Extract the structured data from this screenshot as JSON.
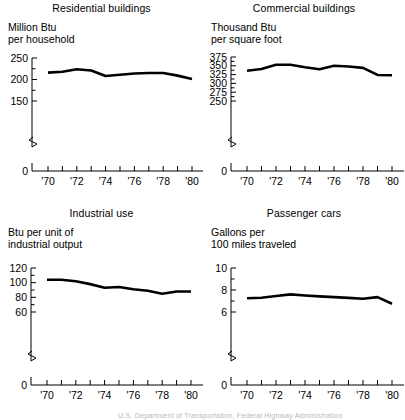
{
  "figure": {
    "footnote": "U.S. Department of Transportation, Federal Highway Administration",
    "line_color": "#000000",
    "background": "#ffffff"
  },
  "panels": [
    {
      "id": "residential",
      "title": "Residential buildings",
      "subtitle": "Million Btu\nper household",
      "ytick_labels": [
        "250",
        "200",
        "150",
        "0"
      ],
      "xtick_labels": [
        "'70",
        "'72",
        "'74",
        "'76",
        "'78",
        "'80"
      ]
    },
    {
      "id": "commercial",
      "title": "Commercial buildings",
      "subtitle": "Thousand Btu\nper square foot",
      "ytick_labels": [
        "375",
        "350",
        "325",
        "300",
        "275",
        "250",
        "0"
      ],
      "xtick_labels": [
        "'70",
        "'72",
        "'74",
        "'76",
        "'78",
        "'80"
      ]
    },
    {
      "id": "industrial",
      "title": "Industrial use",
      "subtitle": "Btu per unit of\nindustrial output",
      "ytick_labels": [
        "120",
        "100",
        "80",
        "60",
        "0"
      ],
      "xtick_labels": [
        "'70",
        "'72",
        "'74",
        "'76",
        "'78",
        "'80"
      ]
    },
    {
      "id": "passenger",
      "title": "Passenger cars",
      "subtitle": "Gallons per\n100 miles traveled",
      "ytick_labels": [
        "10",
        "8",
        "6",
        "0"
      ],
      "xtick_labels": [
        "'70",
        "'72",
        "'74",
        "'76",
        "'78",
        "'80"
      ]
    }
  ],
  "chart_data": [
    {
      "type": "line",
      "id": "residential",
      "title": "Residential buildings",
      "xlabel": "",
      "ylabel": "Million Btu per household",
      "x": [
        1970,
        1971,
        1972,
        1973,
        1974,
        1975,
        1976,
        1977,
        1978,
        1979,
        1980
      ],
      "values": [
        216,
        218,
        224,
        221,
        208,
        211,
        214,
        215,
        215,
        209,
        201
      ],
      "ylim": [
        150,
        250
      ],
      "yticks": [
        150,
        200,
        250
      ],
      "axis_break": true,
      "grid": false,
      "legend": "none"
    },
    {
      "type": "line",
      "id": "commercial",
      "title": "Commercial buildings",
      "xlabel": "",
      "ylabel": "Thousand Btu per square foot",
      "x": [
        1970,
        1971,
        1972,
        1973,
        1974,
        1975,
        1976,
        1977,
        1978,
        1979,
        1980
      ],
      "values": [
        336,
        341,
        353,
        353,
        346,
        340,
        350,
        348,
        344,
        324,
        323
      ],
      "ylim": [
        250,
        375
      ],
      "yticks": [
        250,
        275,
        300,
        325,
        350,
        375
      ],
      "axis_break": true,
      "grid": false,
      "legend": "none"
    },
    {
      "type": "line",
      "id": "industrial",
      "title": "Industrial use",
      "xlabel": "",
      "ylabel": "Btu per unit of industrial output",
      "x": [
        1970,
        1971,
        1972,
        1973,
        1974,
        1975,
        1976,
        1977,
        1978,
        1979,
        1980
      ],
      "values": [
        104,
        104,
        102,
        98,
        93,
        94,
        91,
        89,
        85,
        88,
        88
      ],
      "ylim": [
        60,
        120
      ],
      "yticks": [
        60,
        80,
        100,
        120
      ],
      "axis_break": true,
      "grid": false,
      "legend": "none"
    },
    {
      "type": "line",
      "id": "passenger",
      "title": "Passenger cars",
      "xlabel": "",
      "ylabel": "Gallons per 100 miles traveled",
      "x": [
        1970,
        1971,
        1972,
        1973,
        1974,
        1975,
        1976,
        1977,
        1978,
        1979,
        1980
      ],
      "values": [
        7.25,
        7.3,
        7.45,
        7.6,
        7.5,
        7.42,
        7.35,
        7.28,
        7.2,
        7.35,
        6.75
      ],
      "ylim": [
        6,
        10
      ],
      "yticks": [
        6,
        8,
        10
      ],
      "axis_break": true,
      "grid": false,
      "legend": "none"
    }
  ]
}
